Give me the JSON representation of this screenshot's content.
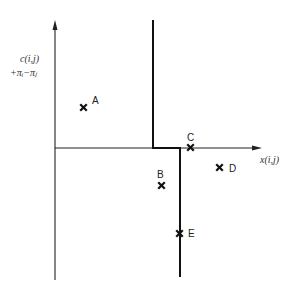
{
  "diagram": {
    "type": "kilter-diagram",
    "y_axis_label_line1": "c(i,j)",
    "y_axis_label_line2": "+π_i−π_j",
    "y_axis_label_line1_display": "c(i,j)",
    "y_axis_label_line2_display": "+πᵢ−πⱼ",
    "x_axis_label": "x(i,j)",
    "points": [
      {
        "label": "A",
        "x_rel": "before lower bound",
        "y_rel": "positive reduced cost"
      },
      {
        "label": "B",
        "x_rel": "between bounds",
        "y_rel": "negative reduced cost"
      },
      {
        "label": "C",
        "x_rel": "between bounds",
        "y_rel": "zero reduced cost"
      },
      {
        "label": "D",
        "x_rel": "beyond upper bound",
        "y_rel": "negative reduced cost"
      },
      {
        "label": "E",
        "x_rel": "at upper bound",
        "y_rel": "negative reduced cost"
      }
    ],
    "curve_description": "Kilter line: vertical at lower bound for positive cost, horizontal along zero cost, vertical at upper bound for negative cost"
  }
}
